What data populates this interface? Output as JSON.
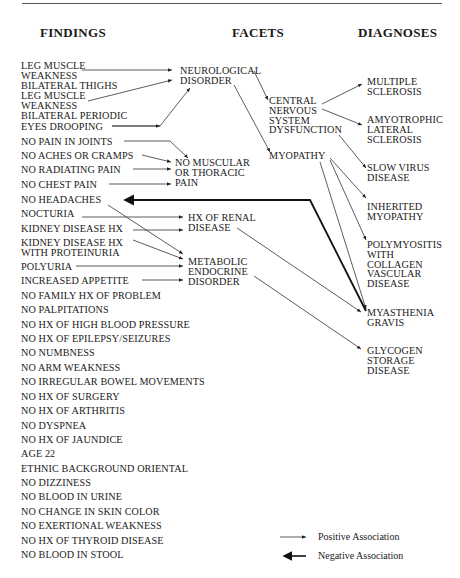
{
  "headers": {
    "findings": "FINDINGS",
    "facets": "FACETS",
    "diagnoses": "DIAGNOSES"
  },
  "findings": [
    [
      "LEG MUSCLE",
      "WEAKNESS",
      "BILATERAL THIGHS"
    ],
    [
      "LEG MUSCLE",
      "WEAKNESS",
      "BILATERAL PERIODIC"
    ],
    [
      "EYES DROOPING"
    ],
    [
      "NO PAIN IN JOINTS"
    ],
    [
      "NO ACHES OR CRAMPS"
    ],
    [
      "NO RADIATING PAIN"
    ],
    [
      "NO CHEST PAIN"
    ],
    [
      "NO HEADACHES"
    ],
    [
      "NOCTURIA"
    ],
    [
      "KIDNEY DISEASE HX"
    ],
    [
      "KIDNEY DISEASE HX",
      "WITH PROTEINURIA"
    ],
    [
      "POLYURIA"
    ],
    [
      "INCREASED APPETITE"
    ],
    [
      "NO FAMILY HX OF PROBLEM"
    ],
    [
      "NO PALPITATIONS"
    ],
    [
      "NO HX OF HIGH BLOOD PRESSURE"
    ],
    [
      "NO HX OF EPILEPSY/SEIZURES"
    ],
    [
      "NO NUMBNESS"
    ],
    [
      "NO ARM WEAKNESS"
    ],
    [
      "NO IRREGULAR BOWEL MOVEMENTS"
    ],
    [
      "NO HX OF SURGERY"
    ],
    [
      "NO HX OF ARTHRITIS"
    ],
    [
      "NO DYSPNEA"
    ],
    [
      "NO HX OF JAUNDICE"
    ],
    [
      "AGE 22"
    ],
    [
      "ETHNIC BACKGROUND ORIENTAL"
    ],
    [
      "NO DIZZINESS"
    ],
    [
      "NO BLOOD IN URINE"
    ],
    [
      "NO CHANGE IN SKIN COLOR"
    ],
    [
      "NO EXERTIONAL WEAKNESS"
    ],
    [
      "NO HX OF THYROID DISEASE"
    ],
    [
      "NO BLOOD IN STOOL"
    ]
  ],
  "facets": {
    "neurological": [
      "NEUROLOGICAL",
      "DISORDER"
    ],
    "cns": [
      "CENTRAL",
      "NERVOUS",
      "SYSTEM",
      "DYSFUNCTION"
    ],
    "myopathy": [
      "MYOPATHY"
    ],
    "muscular": [
      "NO MUSCULAR",
      "OR THORACIC",
      "PAIN"
    ],
    "renal": [
      "HX OF RENAL",
      "DISEASE"
    ],
    "metabolic": [
      "METABOLIC",
      "ENDOCRINE",
      "DISORDER"
    ]
  },
  "diagnoses": {
    "ms": [
      "MULTIPLE",
      "SCLEROSIS"
    ],
    "als": [
      "AMYOTROPHIC",
      "LATERAL",
      "SCLEROSIS"
    ],
    "slow_virus": [
      "SLOW VIRUS",
      "DISEASE"
    ],
    "inherited": [
      "INHERITED",
      "MYOPATHY"
    ],
    "polymyositis": [
      "POLYMYOSITIS",
      "WITH",
      "COLLAGEN",
      "VASCULAR",
      "DISEASE"
    ],
    "myasthenia": [
      "MYASTHENIA",
      "GRAVIS"
    ],
    "glycogen": [
      "GLYCOGEN",
      "STORAGE",
      "DISEASE"
    ]
  },
  "legend": {
    "positive": "Positive Association",
    "negative": "Negative Association"
  }
}
